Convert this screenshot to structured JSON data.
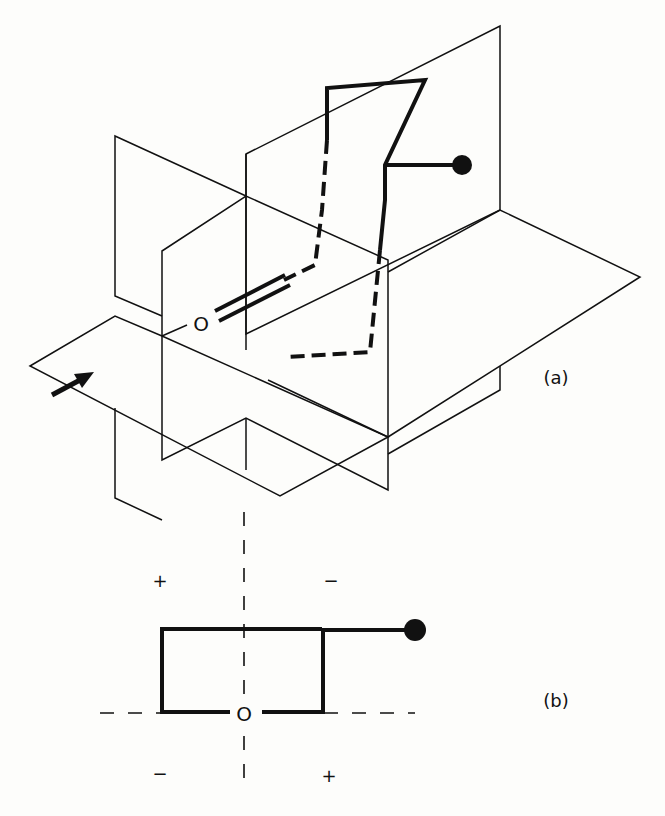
{
  "figure": {
    "panel_a": {
      "label": "(a)",
      "atom_label": "O"
    },
    "panel_b": {
      "label": "(b)",
      "atom_label": "O",
      "quadrant_signs": {
        "top_left": "+",
        "top_right": "−",
        "bottom_left": "−",
        "bottom_right": "+"
      }
    },
    "colors": {
      "ink": "#111111",
      "background": "#fdfdfb"
    }
  }
}
